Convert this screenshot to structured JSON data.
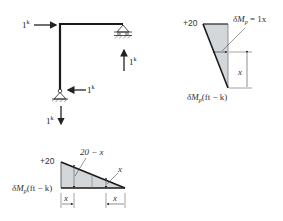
{
  "frame": {
    "load_top_left": "1",
    "load_top_left_unit": "k",
    "reaction_right": "1",
    "reaction_right_unit": "k",
    "reaction_bottom_horizontal": "1",
    "reaction_bottom_horizontal_unit": "k",
    "reaction_bottom_vertical": "1",
    "reaction_bottom_vertical_unit": "k"
  },
  "column_moment_diagram": {
    "top_value": "+20",
    "annotation": "δM",
    "annotation_sub": "p",
    "annotation_rhs": " = 1x",
    "dimension_label": "x",
    "axis_label": "δM",
    "axis_label_sub": "p",
    "axis_label_units": "(ft − k)"
  },
  "beam_moment_diagram": {
    "top_value": "+20",
    "annotation_left": "20 − x",
    "annotation_right": "x",
    "axis_label": "δM",
    "axis_label_sub": "p",
    "axis_label_units": "(ft − k)",
    "dimension_left": "x",
    "dimension_right": "x"
  },
  "colors": {
    "member": "#1a1a1a",
    "fill": "#d4d7da",
    "line": "#222222"
  }
}
